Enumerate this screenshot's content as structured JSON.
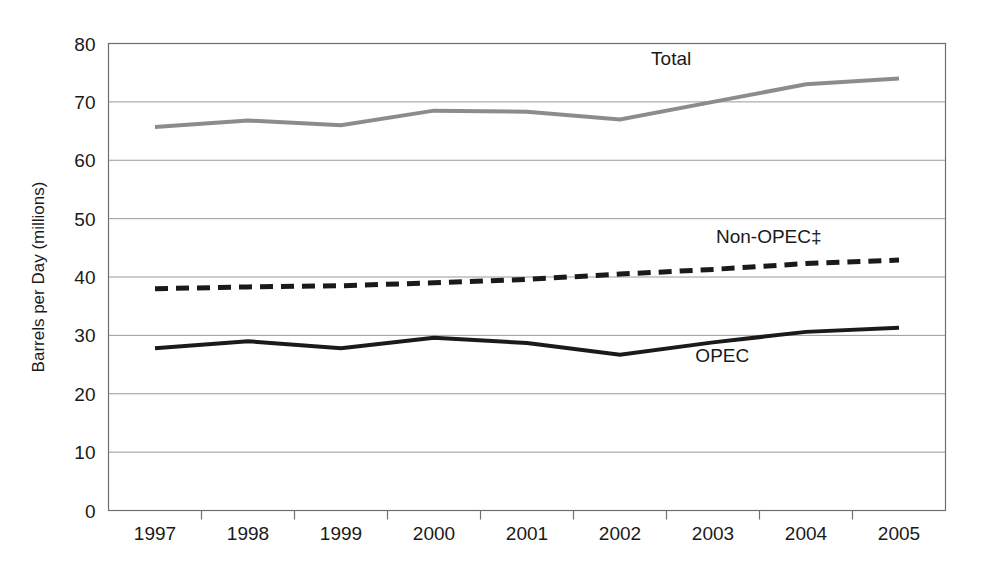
{
  "chart_data": {
    "type": "line",
    "title": "",
    "subtitle": "",
    "xlabel": "",
    "ylabel": "Barrels per Day (millions)",
    "categories": [
      "1997",
      "1998",
      "1999",
      "2000",
      "2001",
      "2002",
      "2003",
      "2004",
      "2005"
    ],
    "x": [
      1997,
      1998,
      1999,
      2000,
      2001,
      2002,
      2003,
      2004,
      2005
    ],
    "xlim": [
      1997,
      2005
    ],
    "ylim": [
      0,
      80
    ],
    "yticks": [
      0,
      10,
      20,
      30,
      40,
      50,
      60,
      70,
      80
    ],
    "ytick_labels": [
      "0",
      "10",
      "20",
      "30",
      "40",
      "50",
      "60",
      "70",
      "80"
    ],
    "grid": true,
    "grid_axis": "y",
    "legend": "inline-labels",
    "legend_position": "inline",
    "series": [
      {
        "name": "Total",
        "label": "Total",
        "color": "#8c8c8c",
        "style": "solid",
        "width": 4,
        "values": [
          65.7,
          66.8,
          66.0,
          68.5,
          68.3,
          67.0,
          70.0,
          73.0,
          74.0
        ],
        "label_x": 2002.55,
        "label_y": 76.4
      },
      {
        "name": "Non-OPEC",
        "label": "Non-OPEC‡",
        "color": "#1a1a1a",
        "style": "dashed",
        "width": 5,
        "values": [
          38.0,
          38.3,
          38.5,
          39.0,
          39.6,
          40.5,
          41.3,
          42.3,
          42.9
        ],
        "label_x": 2003.6,
        "label_y": 45.9
      },
      {
        "name": "OPEC",
        "label": "OPEC",
        "color": "#1a1a1a",
        "style": "solid",
        "width": 4,
        "values": [
          27.8,
          29.0,
          27.8,
          29.6,
          28.7,
          26.7,
          28.8,
          30.6,
          31.3
        ],
        "label_x": 2003.1,
        "label_y": 25.4
      }
    ],
    "colors": {
      "total": "#8c8c8c",
      "non_opec": "#1a1a1a",
      "opec": "#1a1a1a",
      "grid": "#9a9a9a",
      "frame": "#6e6e6e",
      "text": "#1a1a1a",
      "background": "#ffffff"
    }
  }
}
